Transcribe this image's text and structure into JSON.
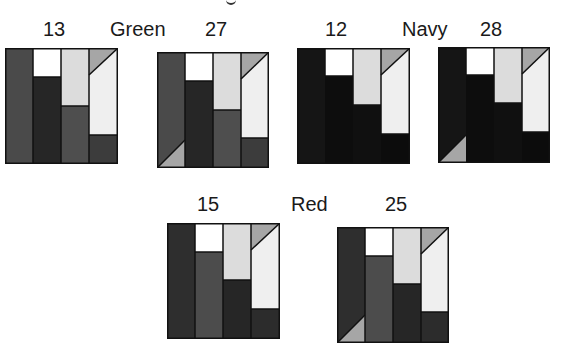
{
  "figure": {
    "top_clipped_fragment": "g",
    "groups": [
      {
        "name": "Green",
        "left_value": "13",
        "right_value": "27",
        "colors": {
          "col1": "#4a4a4a",
          "col2_bottom": "#262626",
          "col3_bottom": "#4e4e4e",
          "col4_bottom": "#3c3c3c"
        }
      },
      {
        "name": "Navy",
        "left_value": "12",
        "right_value": "28",
        "colors": {
          "col1": "#151515",
          "col2_bottom": "#0d0d0d",
          "col3_bottom": "#101010",
          "col4_bottom": "#0c0c0c"
        }
      },
      {
        "name": "Red",
        "left_value": "15",
        "right_value": "25",
        "colors": {
          "col1": "#2e2e2e",
          "col2_bottom": "#4c4c4c",
          "col3_bottom": "#262626",
          "col4_bottom": "#2c2c2c"
        }
      }
    ],
    "shared_colors": {
      "white_block": "#ffffff",
      "light_block": "#dcdcdc",
      "pale_block": "#efefef",
      "triangle": "#a6a6a6",
      "border": "#111111"
    }
  }
}
